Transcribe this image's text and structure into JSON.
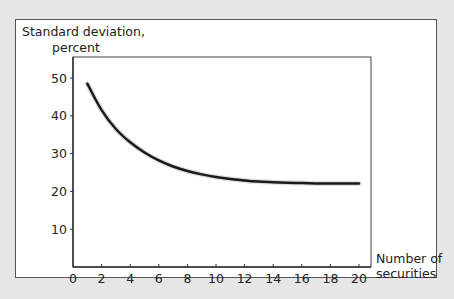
{
  "chart_data": {
    "type": "line",
    "title": "",
    "ylabel": "Standard deviation, percent",
    "ylabel_lines": [
      "Standard deviation,",
      "percent"
    ],
    "xlabel": "Number of securities",
    "xlabel_lines": [
      "Number of",
      "securities"
    ],
    "xlim": [
      0,
      20.5
    ],
    "ylim": [
      0,
      55
    ],
    "xticks": [
      0,
      2,
      4,
      6,
      8,
      10,
      12,
      14,
      16,
      18,
      20
    ],
    "yticks": [
      10,
      20,
      30,
      40,
      50
    ],
    "grid": false,
    "legend": null,
    "series": [
      {
        "name": "Portfolio standard deviation",
        "x": [
          1,
          2,
          3,
          4,
          5,
          6,
          7,
          8,
          9,
          10,
          11,
          12,
          13,
          14,
          15,
          16,
          17,
          18,
          19,
          20
        ],
        "y": [
          48.5,
          41.5,
          36.5,
          33,
          30.3,
          28.2,
          26.6,
          25.4,
          24.5,
          23.8,
          23.3,
          22.9,
          22.6,
          22.4,
          22.3,
          22.2,
          22.1,
          22.1,
          22.1,
          22.1
        ]
      }
    ]
  }
}
